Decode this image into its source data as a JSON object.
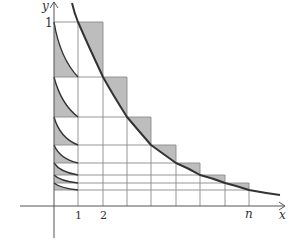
{
  "diagram": {
    "colors": {
      "axis": "#555555",
      "grid": "#8a8a8a",
      "curve": "#333333",
      "shade": "#bdbdbd",
      "background": "#ffffff"
    },
    "axes": {
      "x_label": "x",
      "y_label": "y",
      "y_tick_label": "1",
      "x_tick_labels": [
        "1",
        "2",
        "n"
      ]
    },
    "geometry": {
      "origin_px": [
        54,
        206
      ],
      "x_columns_px": [
        54,
        78,
        103,
        127,
        151,
        176,
        200,
        225,
        249
      ],
      "heights_px": [
        22,
        77,
        117,
        145,
        163,
        175,
        183,
        190
      ]
    }
  }
}
